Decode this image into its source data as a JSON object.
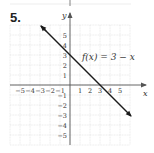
{
  "problem": {
    "number": "5."
  },
  "chart_data": {
    "type": "line",
    "title": "",
    "function_label": "f(x) = 3 − x",
    "xlabel": "x",
    "ylabel": "y",
    "xlim": [
      -6,
      6
    ],
    "ylim": [
      -6,
      6
    ],
    "grid": true,
    "x_ticks": [
      -5,
      -4,
      -3,
      -2,
      -1,
      1,
      2,
      3,
      4,
      5
    ],
    "y_ticks": [
      -5,
      -4,
      -3,
      -2,
      -1,
      1,
      2,
      3,
      4,
      5
    ],
    "x_tick_labels": [
      "−5",
      "−4",
      "−3",
      "−2",
      "−1",
      "1",
      "2",
      "3",
      "4",
      "5"
    ],
    "y_tick_labels": [
      "−5",
      "−4",
      "−3",
      "−2",
      "−1",
      "1",
      "2",
      "3",
      "4",
      "5"
    ],
    "series": [
      {
        "name": "f(x) = 3 − x",
        "slope": -1,
        "intercept": 3,
        "x": [
          -2.9,
          6.1
        ],
        "y": [
          5.9,
          -3.1
        ],
        "arrows": "both"
      }
    ],
    "key_points": {
      "y_intercept": [
        0,
        3
      ],
      "x_intercept": [
        3,
        0
      ]
    }
  },
  "colors": {
    "line": "#1a1a1a",
    "grid": "#d8d8d8",
    "axis": "#555555",
    "text": "#333333"
  }
}
